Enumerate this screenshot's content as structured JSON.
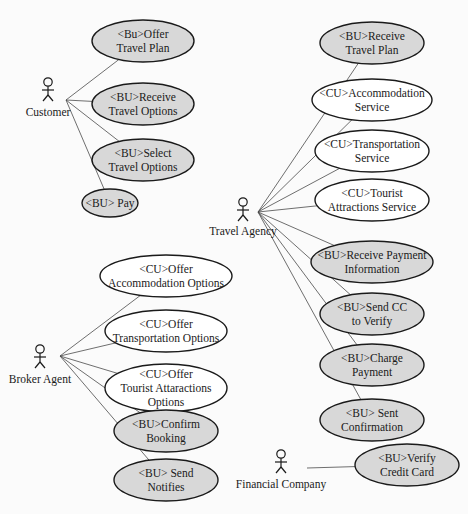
{
  "diagram": {
    "type": "uml-use-case",
    "colors": {
      "business_usecase_fill": "#d8d8d8",
      "collab_usecase_fill": "#ffffff",
      "stroke": "#1a1a1a",
      "line": "#4a4a4a",
      "background": "#fbfbfb"
    },
    "actors": [
      {
        "id": "customer",
        "label": "Customer",
        "x": 48,
        "y": 88,
        "label_y": 116,
        "anchor": [
          66,
          100
        ]
      },
      {
        "id": "travel-agency",
        "label": "Travel Agency",
        "x": 243,
        "y": 208,
        "label_y": 235,
        "anchor": [
          258,
          212
        ]
      },
      {
        "id": "broker-agent",
        "label": "Broker Agent",
        "x": 40,
        "y": 355,
        "label_y": 383,
        "anchor": [
          60,
          356
        ]
      },
      {
        "id": "financial-company",
        "label": "Financial Company",
        "x": 281,
        "y": 460,
        "label_y": 488,
        "anchor": [
          307,
          468
        ]
      }
    ],
    "use_cases": [
      {
        "id": "offer-travel-plan",
        "kind": "bu",
        "lines": [
          "<Bu>Offer",
          "Travel Plan"
        ],
        "cx": 143,
        "cy": 41,
        "rx": 51,
        "ry": 21,
        "actor": "customer"
      },
      {
        "id": "receive-travel-options",
        "kind": "bu",
        "lines": [
          "<BU>Receive",
          "Travel Options"
        ],
        "cx": 143,
        "cy": 104,
        "rx": 51,
        "ry": 21,
        "actor": "customer"
      },
      {
        "id": "select-travel-options",
        "kind": "bu",
        "lines": [
          "<BU>Select",
          "Travel Options"
        ],
        "cx": 143,
        "cy": 160,
        "rx": 51,
        "ry": 21,
        "actor": "customer"
      },
      {
        "id": "pay",
        "kind": "bu",
        "lines": [
          "<BU> Pay"
        ],
        "cx": 110,
        "cy": 203,
        "rx": 28,
        "ry": 14,
        "actor": "customer"
      },
      {
        "id": "receive-travel-plan",
        "kind": "bu",
        "lines": [
          "<BU>Receive",
          "Travel Plan"
        ],
        "cx": 372,
        "cy": 43,
        "rx": 52,
        "ry": 21,
        "actor": "travel-agency"
      },
      {
        "id": "accommodation-service",
        "kind": "cu",
        "lines": [
          "<CU>Accommodation",
          "Service"
        ],
        "cx": 372,
        "cy": 100,
        "rx": 60,
        "ry": 21,
        "actor": "travel-agency"
      },
      {
        "id": "transportation-service",
        "kind": "cu",
        "lines": [
          "<CU>Transportation",
          "Service"
        ],
        "cx": 372,
        "cy": 151,
        "rx": 57,
        "ry": 21,
        "actor": "travel-agency"
      },
      {
        "id": "tourist-attractions-service",
        "kind": "cu",
        "lines": [
          "<CU>Tourist",
          "Attractions Service"
        ],
        "cx": 372,
        "cy": 200,
        "rx": 57,
        "ry": 21,
        "actor": "travel-agency"
      },
      {
        "id": "receive-payment-information",
        "kind": "bu",
        "lines": [
          "<BU>Receive Payment",
          "Information"
        ],
        "cx": 372,
        "cy": 262,
        "rx": 61,
        "ry": 21,
        "actor": "travel-agency"
      },
      {
        "id": "send-cc-to-verify",
        "kind": "bu",
        "lines": [
          "<BU>Send CC",
          "to Verify"
        ],
        "cx": 372,
        "cy": 314,
        "rx": 52,
        "ry": 21,
        "actor": "travel-agency"
      },
      {
        "id": "charge-payment",
        "kind": "bu",
        "lines": [
          "<BU>Charge",
          "Payment"
        ],
        "cx": 372,
        "cy": 365,
        "rx": 52,
        "ry": 21,
        "actor": "travel-agency"
      },
      {
        "id": "sent-confirmation",
        "kind": "bu",
        "lines": [
          "<BU> Sent",
          "Confirmation"
        ],
        "cx": 372,
        "cy": 420,
        "rx": 52,
        "ry": 21,
        "actor": "travel-agency"
      },
      {
        "id": "offer-accommodation-options",
        "kind": "cu",
        "lines": [
          "<CU>Offer",
          "Accommodation Options"
        ],
        "cx": 166,
        "cy": 276,
        "rx": 66,
        "ry": 21,
        "actor": "broker-agent"
      },
      {
        "id": "offer-transportation-options",
        "kind": "cu",
        "lines": [
          "<CU>Offer",
          "Transportation Options"
        ],
        "cx": 166,
        "cy": 331,
        "rx": 61,
        "ry": 21,
        "actor": "broker-agent"
      },
      {
        "id": "offer-tourist-attaractions-options",
        "kind": "cu",
        "lines": [
          "<CU>Offer",
          "Tourist Attaractions",
          "Options"
        ],
        "cx": 166,
        "cy": 388,
        "rx": 61,
        "ry": 24,
        "actor": "broker-agent"
      },
      {
        "id": "confirm-booking",
        "kind": "bu",
        "lines": [
          "<BU>Confirm",
          "Booking"
        ],
        "cx": 166,
        "cy": 431,
        "rx": 52,
        "ry": 21,
        "actor": "broker-agent"
      },
      {
        "id": "send-notifies",
        "kind": "bu",
        "lines": [
          "<BU> Send",
          "Notifies"
        ],
        "cx": 166,
        "cy": 480,
        "rx": 52,
        "ry": 21,
        "actor": "broker-agent"
      },
      {
        "id": "verify-credit-card",
        "kind": "bu",
        "lines": [
          "<BU>Verify",
          "Credit Card"
        ],
        "cx": 407,
        "cy": 465,
        "rx": 52,
        "ry": 21,
        "actor": "financial-company"
      }
    ]
  }
}
